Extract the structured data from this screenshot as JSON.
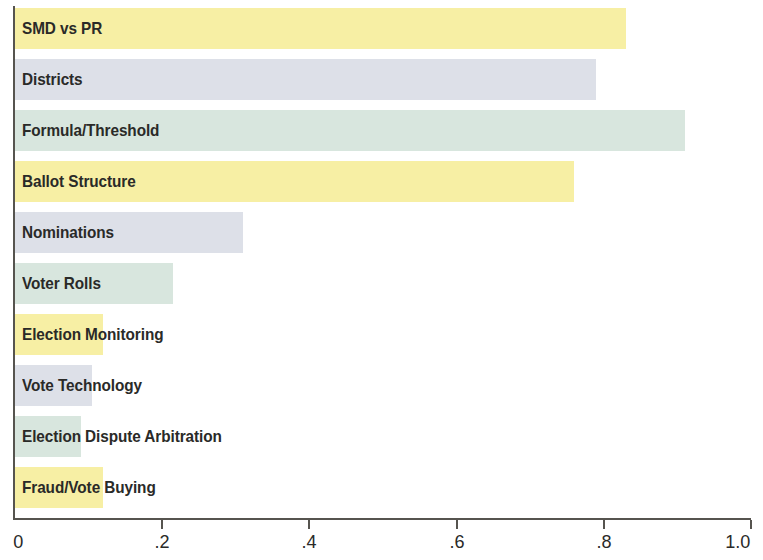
{
  "chart_data": {
    "type": "bar",
    "orientation": "horizontal",
    "title": "",
    "xlabel": "",
    "ylabel": "",
    "xlim": [
      0,
      1.0
    ],
    "grid": false,
    "legend": null,
    "axis_ticks": [
      "0",
      ".2",
      ".4",
      ".6",
      ".8",
      "1.0"
    ],
    "axis_tick_values": [
      0,
      0.2,
      0.4,
      0.6,
      0.8,
      1.0
    ],
    "categories": [
      "SMD vs PR",
      "Districts",
      "Formula/Threshold",
      "Ballot Structure",
      "Nominations",
      "Voter Rolls",
      "Election Monitoring",
      "Vote Technology",
      "Election Dispute Arbitration",
      "Fraud/Vote Buying"
    ],
    "values": [
      0.83,
      0.79,
      0.91,
      0.76,
      0.31,
      0.215,
      0.12,
      0.105,
      0.09,
      0.12
    ],
    "bar_colors": [
      "#f7efa4",
      "#dde0e8",
      "#d8e6de",
      "#f7efa4",
      "#dde0e8",
      "#d8e6de",
      "#f7efa4",
      "#dde0e8",
      "#d8e6de",
      "#f7efa4"
    ],
    "palette": {
      "yellow": "#f7efa4",
      "lavender": "#dde0e8",
      "mint": "#d8e6de",
      "axis": "#56544f",
      "text": "#2a2a28"
    }
  }
}
